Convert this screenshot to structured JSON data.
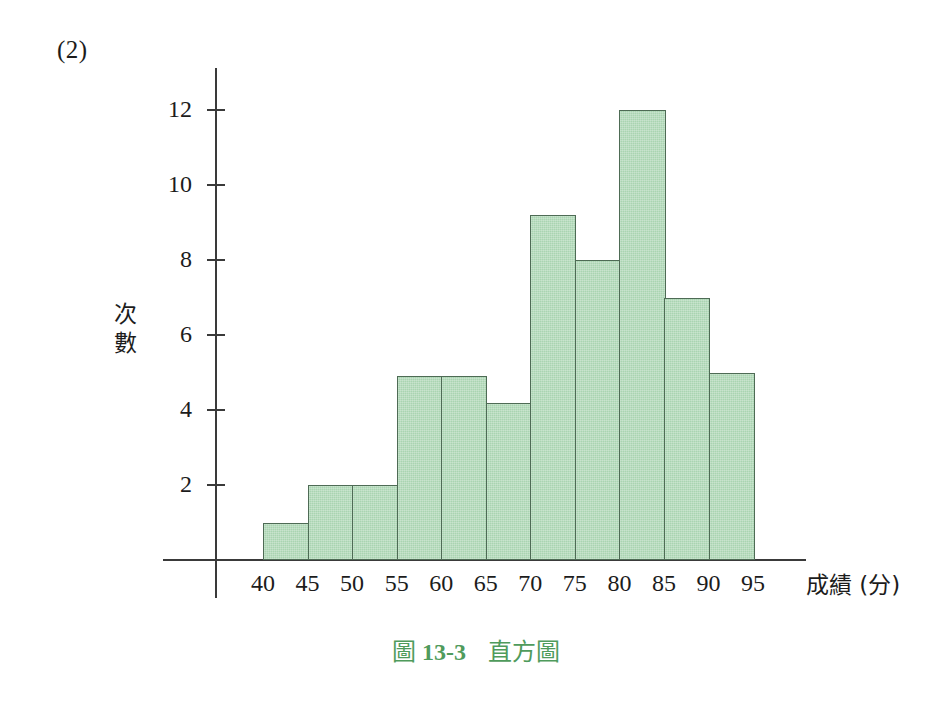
{
  "item_number": "(2)",
  "caption": {
    "prefix": "圖",
    "number": "13-3",
    "title": "直方圖"
  },
  "axes": {
    "y_title": "次數",
    "y_title_chars": [
      "次",
      "數"
    ],
    "x_title": "成績 (分)"
  },
  "colors": {
    "bar_fill": "#a9d4b1",
    "bar_stroke": "#4e6b55",
    "axis": "#3a3a3a",
    "caption": "#4f9b5c",
    "text": "#1c1c1c"
  },
  "chart_data": {
    "type": "bar",
    "xlabel": "成績 (分)",
    "ylabel": "次數",
    "bin_edges": [
      40,
      45,
      50,
      55,
      60,
      65,
      70,
      75,
      80,
      85,
      90,
      95
    ],
    "categories": [
      "40-45",
      "45-50",
      "50-55",
      "55-60",
      "60-65",
      "65-70",
      "70-75",
      "75-80",
      "80-85",
      "85-90",
      "90-95"
    ],
    "values": [
      1,
      2,
      2,
      4.9,
      4.9,
      4.2,
      9.2,
      8,
      12,
      7,
      5
    ],
    "xticks": [
      "40",
      "45",
      "50",
      "55",
      "60",
      "65",
      "70",
      "75",
      "80",
      "85",
      "90",
      "95"
    ],
    "yticks": [
      2,
      4,
      6,
      8,
      10,
      12
    ],
    "ytick_labels": [
      "2",
      "4",
      "6",
      "8",
      "10",
      "12"
    ],
    "ylim": [
      0,
      13.1
    ],
    "xlim": [
      40,
      95
    ],
    "grid": false,
    "legend": false
  }
}
